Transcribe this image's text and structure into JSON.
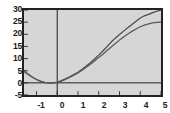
{
  "chart_data": {
    "type": "line",
    "title": "",
    "xlabel": "",
    "ylabel": "",
    "xlim": [
      -1.6,
      5.0
    ],
    "ylim": [
      -5,
      30
    ],
    "grid": false,
    "legend": null,
    "background_color": "#d6d6d6",
    "frame_color": "#222222",
    "curve_color": "#4a4a4a",
    "axis_line_color": "#1a1a1a",
    "x_ticks": [
      -1,
      0,
      1,
      2,
      3,
      4,
      5
    ],
    "x_tick_labels": [
      "-1",
      "0",
      "1",
      "2",
      "3",
      "4",
      "5"
    ],
    "y_ticks": [
      -5,
      0,
      5,
      10,
      15,
      20,
      25,
      30
    ],
    "y_tick_labels": [
      "-5",
      "0",
      "5",
      "10",
      "15",
      "20",
      "25",
      "30"
    ],
    "series": [
      {
        "name": "curve-upper",
        "x": [
          -1.6,
          -1.4,
          -1.2,
          -1.0,
          -0.8,
          -0.6,
          -0.4,
          -0.2,
          0.0,
          0.2,
          0.4,
          0.6,
          0.8,
          1.0,
          1.2,
          1.4,
          1.6,
          1.8,
          2.0,
          2.2,
          2.4,
          2.6,
          2.8,
          3.0,
          3.2,
          3.4,
          3.6,
          3.8,
          4.0,
          4.2,
          4.4,
          4.6,
          4.8,
          5.0
        ],
        "y": [
          5.0,
          3.6,
          2.4,
          1.4,
          0.6,
          0.1,
          0.0,
          0.0,
          0.3,
          0.9,
          1.7,
          2.5,
          3.4,
          4.4,
          5.6,
          6.9,
          8.3,
          9.8,
          11.4,
          13.1,
          14.9,
          16.8,
          18.4,
          19.9,
          21.3,
          22.7,
          24.0,
          25.4,
          26.7,
          27.6,
          28.2,
          28.9,
          29.5,
          30.0
        ]
      },
      {
        "name": "curve-lower",
        "x": [
          -1.6,
          -1.4,
          -1.2,
          -1.0,
          -0.8,
          -0.6,
          -0.4,
          -0.2,
          0.0,
          0.2,
          0.4,
          0.6,
          0.8,
          1.0,
          1.2,
          1.4,
          1.6,
          1.8,
          2.0,
          2.2,
          2.4,
          2.6,
          2.8,
          3.0,
          3.2,
          3.4,
          3.6,
          3.8,
          4.0,
          4.2,
          4.4,
          4.6,
          4.8,
          5.0
        ],
        "y": [
          4.6,
          3.4,
          2.3,
          1.4,
          0.7,
          0.2,
          0.0,
          0.0,
          0.2,
          0.7,
          1.4,
          2.2,
          3.1,
          4.1,
          5.2,
          6.4,
          7.7,
          9.0,
          10.4,
          11.8,
          13.3,
          14.8,
          16.2,
          17.6,
          18.9,
          20.1,
          21.2,
          22.2,
          23.1,
          23.8,
          24.3,
          24.7,
          24.9,
          25.0
        ]
      }
    ],
    "axis_lines": {
      "x_axis_at_y": 0,
      "y_axis_at_x": 0
    }
  }
}
